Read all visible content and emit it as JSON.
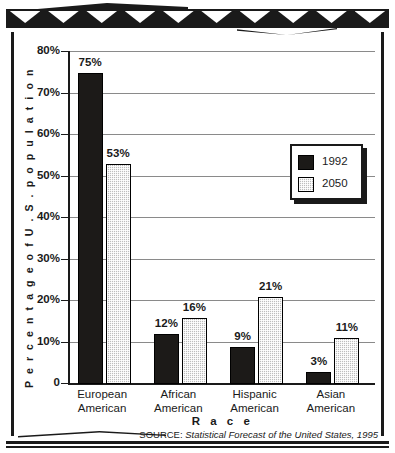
{
  "chart_data": {
    "type": "bar",
    "title": "",
    "categories": [
      "European\nAmerican",
      "African\nAmerican",
      "Hispanic\nAmerican",
      "Asian\nAmerican"
    ],
    "category_labels": [
      {
        "line1": "European",
        "line2": "American"
      },
      {
        "line1": "African",
        "line2": "American"
      },
      {
        "line1": "Hispanic",
        "line2": "American"
      },
      {
        "line1": "Asian",
        "line2": "American"
      }
    ],
    "series": [
      {
        "name": "1992",
        "values": [
          75,
          12,
          9,
          3
        ],
        "value_labels": [
          "75%",
          "12%",
          "9%",
          "3%"
        ],
        "color": "#1c1a18"
      },
      {
        "name": "2050",
        "values": [
          53,
          16,
          21,
          11
        ],
        "value_labels": [
          "53%",
          "16%",
          "21%",
          "11%"
        ],
        "color": "#bdbdbd"
      }
    ],
    "xlabel": "R a c e",
    "ylabel": "P e r c e n t a g e   o f   U . S .   p o p u l a t i o n",
    "ylim": [
      0,
      80
    ],
    "ytick_values": [
      0,
      10,
      20,
      30,
      40,
      50,
      60,
      70,
      80
    ],
    "ytick_labels": [
      "0",
      "10%",
      "20%",
      "30%",
      "40%",
      "50%",
      "60%",
      "70%",
      "80%"
    ],
    "grid": true,
    "legend_position": "upper right",
    "source": "SOURCE: ",
    "source_italic": "Statistical Forecast of the United States, 1995"
  },
  "legend": {
    "items": [
      {
        "label": "1992",
        "swatch": "black-square-icon"
      },
      {
        "label": "2050",
        "swatch": "gray-dotted-square-icon"
      }
    ]
  },
  "colors": {
    "series_1992": "#1c1a18",
    "series_2050": "#bdbdbd",
    "gridline": "#8a8a8a",
    "frame": "#1a1a1a",
    "background": "#ffffff"
  }
}
